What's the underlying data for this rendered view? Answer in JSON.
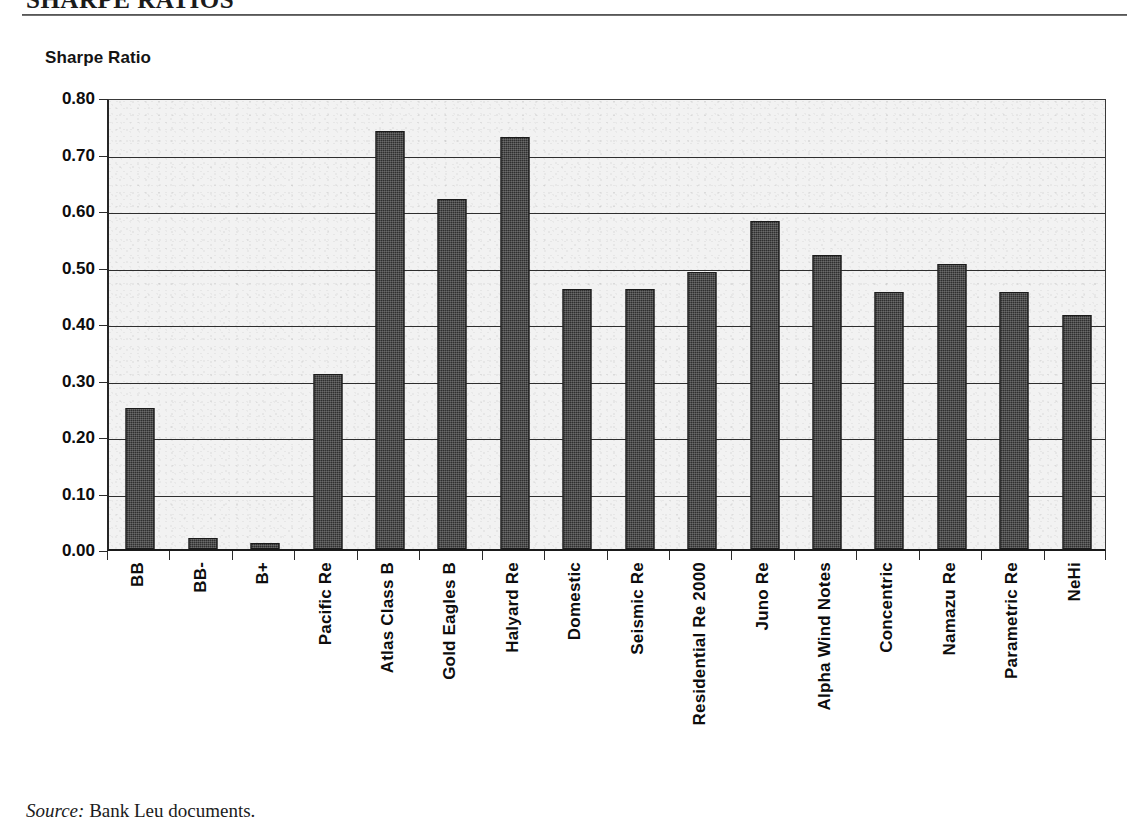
{
  "document": {
    "title": "SHARPE RATIOS",
    "source_label": "Source:",
    "source_text": "Bank Leu documents."
  },
  "chart_data": {
    "type": "bar",
    "title": "SHARPE RATIOS",
    "xlabel": "",
    "ylabel": "Sharpe Ratio",
    "ylim": [
      0.0,
      0.8
    ],
    "ytick_labels": [
      "0.80",
      "0.70",
      "0.60",
      "0.50",
      "0.40",
      "0.30",
      "0.20",
      "0.10",
      "0.00"
    ],
    "ytick_values": [
      0.8,
      0.7,
      0.6,
      0.5,
      0.4,
      0.3,
      0.2,
      0.1,
      0.0
    ],
    "grid": true,
    "legend": "none",
    "bar_color": "#2f2f2f",
    "plot_background": "#f2f2f2",
    "categories": [
      "BB",
      "BB-",
      "B+",
      "Pacific Re",
      "Atlas Class B",
      "Gold Eagles B",
      "Halyard Re",
      "Domestic",
      "Seismic Re",
      "Residential Re 2000",
      "Juno Re",
      "Alpha Wind Notes",
      "Concentric",
      "Namazu Re",
      "Parametric Re",
      "NeHi"
    ],
    "values": [
      0.25,
      0.02,
      0.01,
      0.31,
      0.74,
      0.62,
      0.73,
      0.46,
      0.46,
      0.49,
      0.58,
      0.52,
      0.455,
      0.505,
      0.455,
      0.415
    ]
  }
}
